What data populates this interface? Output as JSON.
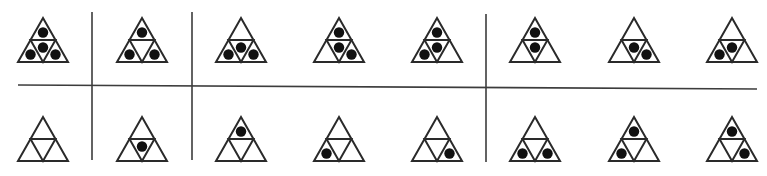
{
  "figure": {
    "colors": {
      "line": "#2a2a2a",
      "dot": "#111111",
      "divider": "#3c3c3c",
      "background": "#ffffff"
    },
    "triangle_size": {
      "width": 50,
      "height": 44
    },
    "dividers": {
      "horizontal": {
        "x1": 18,
        "y1": 85,
        "x2": 757,
        "y2": 89
      },
      "vertical": [
        {
          "x": 92,
          "y1": 12,
          "y2": 160
        },
        {
          "x": 192,
          "y1": 12,
          "y2": 160
        },
        {
          "x": 486,
          "y1": 14,
          "y2": 162
        }
      ]
    },
    "rows": [
      {
        "name": "top-row",
        "apex_y": 18,
        "triangles": [
          {
            "apex_x": 43,
            "dots": [
              "top",
              "center",
              "left",
              "right"
            ]
          },
          {
            "apex_x": 142,
            "dots": [
              "top",
              "left",
              "right"
            ]
          },
          {
            "apex_x": 241,
            "dots": [
              "center",
              "left",
              "right"
            ]
          },
          {
            "apex_x": 339,
            "dots": [
              "top",
              "center",
              "right"
            ]
          },
          {
            "apex_x": 437,
            "dots": [
              "top",
              "center",
              "left"
            ]
          },
          {
            "apex_x": 535,
            "dots": [
              "top",
              "center"
            ]
          },
          {
            "apex_x": 634,
            "dots": [
              "center",
              "right"
            ]
          },
          {
            "apex_x": 732,
            "dots": [
              "center",
              "left"
            ]
          }
        ]
      },
      {
        "name": "bottom-row",
        "apex_y": 117,
        "triangles": [
          {
            "apex_x": 43,
            "dots": []
          },
          {
            "apex_x": 142,
            "dots": [
              "center"
            ]
          },
          {
            "apex_x": 241,
            "dots": [
              "top"
            ]
          },
          {
            "apex_x": 339,
            "dots": [
              "left"
            ]
          },
          {
            "apex_x": 437,
            "dots": [
              "right"
            ]
          },
          {
            "apex_x": 535,
            "dots": [
              "left",
              "right"
            ]
          },
          {
            "apex_x": 634,
            "dots": [
              "top",
              "left"
            ]
          },
          {
            "apex_x": 732,
            "dots": [
              "top",
              "right"
            ]
          }
        ]
      }
    ]
  }
}
